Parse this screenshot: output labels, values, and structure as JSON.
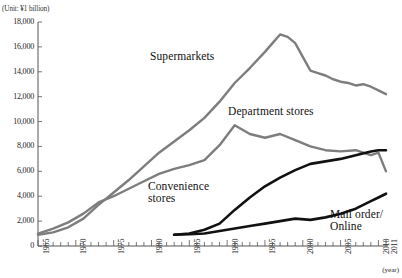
{
  "unit_note": "(Unit: ¥1 billion)",
  "year_note": "(year)",
  "axis": {
    "y_ticks": [
      "18,000",
      "16,000",
      "14,000",
      "12,000",
      "10,000",
      "8,000",
      "6,000",
      "4,000",
      "2,000",
      "0"
    ],
    "x_ticks": [
      "1965",
      "1970",
      "1975",
      "1980",
      "1985",
      "1990",
      "1995",
      "2000",
      "2005",
      "2010",
      "2011"
    ]
  },
  "series_labels": {
    "supermarkets": "Supermarkets",
    "department": "Department stores",
    "convenience_line1": "Convenience",
    "convenience_line2": "stores",
    "mail_line1": "Mail order/",
    "mail_line2": "Online"
  },
  "colors": {
    "gray_series": "#7d7d7d",
    "black_series": "#111111",
    "axis": "#555555"
  },
  "chart_data": {
    "type": "line",
    "title": "",
    "xlabel": "(year)",
    "ylabel": "(Unit: ¥1 billion)",
    "xlim": [
      1965,
      2011
    ],
    "ylim": [
      0,
      18000
    ],
    "y_tick_step": 2000,
    "grid": false,
    "legend": "inline-annotations",
    "series": [
      {
        "name": "Supermarkets",
        "color": "#7d7d7d",
        "x": [
          1965,
          1967,
          1969,
          1971,
          1973,
          1975,
          1977,
          1979,
          1981,
          1983,
          1985,
          1987,
          1989,
          1991,
          1993,
          1995,
          1996,
          1997,
          1998,
          1999,
          2000,
          2001,
          2002,
          2003,
          2004,
          2005,
          2006,
          2007,
          2008,
          2009,
          2010,
          2011
        ],
        "values": [
          900,
          1100,
          1500,
          2200,
          3300,
          4300,
          5300,
          6400,
          7500,
          8400,
          9300,
          10300,
          11600,
          13100,
          14300,
          15600,
          16300,
          17000,
          16800,
          16300,
          15200,
          14100,
          13900,
          13700,
          13400,
          13200,
          13100,
          12900,
          13000,
          12800,
          12500,
          12200
        ]
      },
      {
        "name": "Department stores",
        "color": "#7d7d7d",
        "x": [
          1965,
          1967,
          1969,
          1971,
          1973,
          1975,
          1977,
          1979,
          1981,
          1983,
          1985,
          1987,
          1989,
          1991,
          1993,
          1995,
          1997,
          1999,
          2001,
          2003,
          2005,
          2007,
          2009,
          2010,
          2011
        ],
        "values": [
          1000,
          1400,
          1900,
          2600,
          3500,
          4000,
          4600,
          5200,
          5800,
          6200,
          6500,
          6900,
          8100,
          9700,
          9000,
          8700,
          9000,
          8500,
          8000,
          7700,
          7600,
          7700,
          7300,
          7500,
          6000
        ]
      },
      {
        "name": "Convenience stores",
        "color": "#111111",
        "x": [
          1983,
          1985,
          1987,
          1989,
          1991,
          1993,
          1995,
          1997,
          1999,
          2001,
          2003,
          2005,
          2007,
          2009,
          2010,
          2011
        ],
        "values": [
          900,
          1000,
          1300,
          1800,
          2900,
          3900,
          4800,
          5500,
          6100,
          6600,
          6800,
          7000,
          7300,
          7600,
          7700,
          7700
        ]
      },
      {
        "name": "Mail order/Online",
        "color": "#111111",
        "x": [
          1983,
          1985,
          1987,
          1989,
          1991,
          1993,
          1995,
          1997,
          1999,
          2001,
          2003,
          2005,
          2007,
          2009,
          2010,
          2011
        ],
        "values": [
          900,
          950,
          1000,
          1200,
          1400,
          1600,
          1800,
          2000,
          2200,
          2100,
          2300,
          2600,
          3000,
          3600,
          3900,
          4200
        ]
      }
    ]
  }
}
